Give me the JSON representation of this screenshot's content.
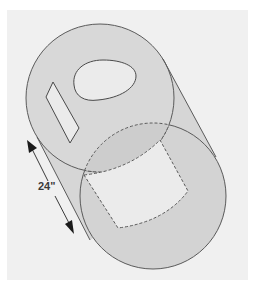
{
  "diagram": {
    "type": "oblique cylinder with cutouts",
    "dimension": {
      "label": "24\"",
      "description": "length of cylinder along its axis"
    },
    "shapes": [
      {
        "name": "near-end-circle",
        "style": "solid"
      },
      {
        "name": "far-end-circle",
        "style": "solid, partly hidden"
      },
      {
        "name": "oval-hole",
        "style": "solid"
      },
      {
        "name": "slot-cutout",
        "style": "solid"
      },
      {
        "name": "rectangular-opening",
        "style": "dashed (hidden)"
      }
    ],
    "colors": {
      "background": "#ffffff",
      "panel": "#f0f0f0",
      "fill": "#d6d6d6",
      "cutout_fill": "#ececec",
      "stroke": "#5a5a5a",
      "arrow": "#1a1a1a"
    }
  }
}
